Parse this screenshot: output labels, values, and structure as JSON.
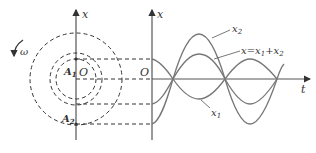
{
  "left_panel": {
    "axis_label": "x",
    "omega_label": "ω",
    "origin_label": "O",
    "phasor_1_label": "A",
    "phasor_1_sub": "1",
    "phasor_2_label": "A",
    "phasor_2_sub": "2"
  },
  "right_panel": {
    "y_axis_label": "x",
    "x_axis_label": "t",
    "origin_label": "O",
    "curve_x2_label": "x",
    "curve_x2_sub": "2",
    "curve_sum_label_a": "x=x",
    "curve_sum_sub_1": "1",
    "curve_sum_plus": "+x",
    "curve_sum_sub_2": "2",
    "curve_x1_label": "x",
    "curve_x1_sub": "1"
  },
  "colors": {
    "line": "#555555",
    "dash": "#333333",
    "curve": "#777777"
  }
}
